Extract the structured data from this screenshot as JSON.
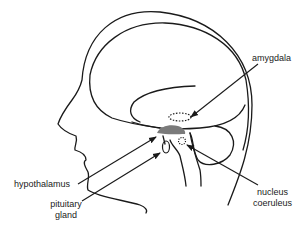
{
  "diagram": {
    "colors": {
      "line": "#1a1a1a",
      "hypothalamus_fill": "#7a7a7a",
      "background": "#ffffff"
    },
    "labels": {
      "amygdala": "amygdala",
      "hypothalamus": "hypothalamus",
      "pituitary_line1": "pituitary",
      "pituitary_line2": "gland",
      "nucleus_line1": "nucleus",
      "nucleus_line2": "coeruleus"
    }
  }
}
